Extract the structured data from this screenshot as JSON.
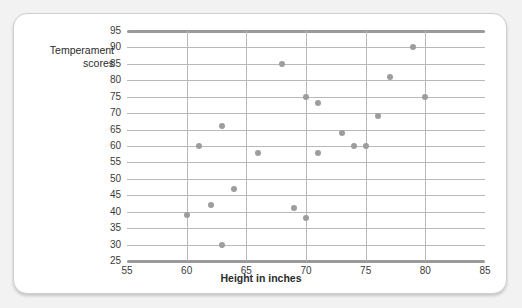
{
  "figure": {
    "background_color": "#f2f2f2",
    "card_color": "#ffffff",
    "point_color": "#9d9d9d",
    "grid_color": "#b9b9b9",
    "axis_color": "#9a9a9a"
  },
  "chart_data": {
    "type": "scatter",
    "title": "",
    "xlabel": "Height in inches",
    "ylabel": "Temperament\nscores",
    "xlim": [
      55,
      85
    ],
    "ylim": [
      25,
      95
    ],
    "xticks": [
      55,
      60,
      65,
      70,
      75,
      80,
      85
    ],
    "xtick_labels": [
      "55",
      "60",
      "65",
      "70",
      "75",
      "80",
      "85"
    ],
    "yticks": [
      25,
      30,
      35,
      40,
      45,
      50,
      55,
      60,
      65,
      70,
      75,
      80,
      85,
      90,
      95
    ],
    "ytick_labels": [
      "25",
      "30",
      "35",
      "40",
      "45",
      "50",
      "55",
      "60",
      "65",
      "70",
      "75",
      "80",
      "85",
      "90",
      "95"
    ],
    "grid": true,
    "grid_axis": "both",
    "legend": false,
    "series": [
      {
        "name": "Height vs temperament",
        "marker": "circle",
        "color": "#9d9d9d",
        "points": [
          {
            "x": 60,
            "y": 39
          },
          {
            "x": 61,
            "y": 60
          },
          {
            "x": 62,
            "y": 42
          },
          {
            "x": 63,
            "y": 30
          },
          {
            "x": 63,
            "y": 66
          },
          {
            "x": 64,
            "y": 47
          },
          {
            "x": 66,
            "y": 58
          },
          {
            "x": 68,
            "y": 85
          },
          {
            "x": 69,
            "y": 41
          },
          {
            "x": 70,
            "y": 38
          },
          {
            "x": 70,
            "y": 75
          },
          {
            "x": 71,
            "y": 58
          },
          {
            "x": 71,
            "y": 73
          },
          {
            "x": 73,
            "y": 64
          },
          {
            "x": 74,
            "y": 60
          },
          {
            "x": 75,
            "y": 60
          },
          {
            "x": 76,
            "y": 69
          },
          {
            "x": 77,
            "y": 81
          },
          {
            "x": 79,
            "y": 90
          },
          {
            "x": 80,
            "y": 75
          }
        ]
      }
    ]
  }
}
